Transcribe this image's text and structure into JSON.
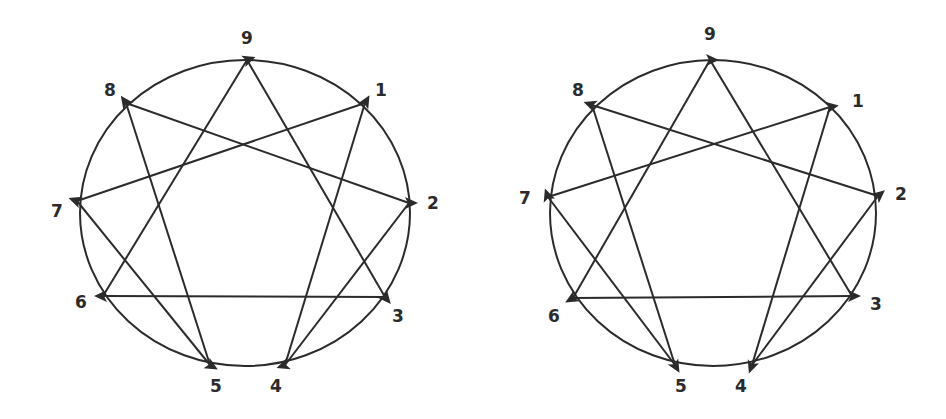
{
  "diagrams": [
    {
      "id": "left",
      "circle": {
        "cx": 245,
        "cy": 213,
        "rx": 165,
        "ry": 153
      },
      "points": {
        "9": {
          "x": 247,
          "y": 60,
          "lx": 247,
          "ly": 44
        },
        "1": {
          "x": 365,
          "y": 103,
          "lx": 381,
          "ly": 96
        },
        "2": {
          "x": 409,
          "y": 203,
          "lx": 433,
          "ly": 209
        },
        "3": {
          "x": 385,
          "y": 297,
          "lx": 398,
          "ly": 322
        },
        "4": {
          "x": 285,
          "y": 365,
          "lx": 276,
          "ly": 392
        },
        "5": {
          "x": 210,
          "y": 365,
          "lx": 216,
          "ly": 392
        },
        "6": {
          "x": 103,
          "y": 296,
          "lx": 81,
          "ly": 308
        },
        "7": {
          "x": 77,
          "y": 201,
          "lx": 57,
          "ly": 217
        },
        "8": {
          "x": 126,
          "y": 103,
          "lx": 110,
          "ly": 96
        }
      },
      "edges": [
        [
          "9",
          "3"
        ],
        [
          "3",
          "6"
        ],
        [
          "6",
          "9"
        ],
        [
          "1",
          "4"
        ],
        [
          "4",
          "2"
        ],
        [
          "2",
          "8"
        ],
        [
          "8",
          "5"
        ],
        [
          "5",
          "7"
        ],
        [
          "7",
          "1"
        ]
      ],
      "arrows": [
        {
          "at": "9",
          "angle": -20
        },
        {
          "at": "1",
          "angle": -60
        },
        {
          "at": "2",
          "angle": 0
        },
        {
          "at": "3",
          "angle": 50
        },
        {
          "at": "4",
          "angle": 160
        },
        {
          "at": "5",
          "angle": 30
        },
        {
          "at": "6",
          "angle": 180
        },
        {
          "at": "7",
          "angle": 200
        },
        {
          "at": "8",
          "angle": 235
        }
      ]
    },
    {
      "id": "right",
      "circle": {
        "cx": 713,
        "cy": 213,
        "rx": 163,
        "ry": 153
      },
      "points": {
        "9": {
          "x": 710,
          "y": 60,
          "lx": 710,
          "ly": 40
        },
        "1": {
          "x": 830,
          "y": 107,
          "lx": 858,
          "ly": 107
        },
        "2": {
          "x": 878,
          "y": 196,
          "lx": 901,
          "ly": 200
        },
        "3": {
          "x": 852,
          "y": 296,
          "lx": 876,
          "ly": 310
        },
        "4": {
          "x": 752,
          "y": 365,
          "lx": 741,
          "ly": 392
        },
        "5": {
          "x": 675,
          "y": 365,
          "lx": 681,
          "ly": 392
        },
        "6": {
          "x": 573,
          "y": 298,
          "lx": 554,
          "ly": 322
        },
        "7": {
          "x": 548,
          "y": 197,
          "lx": 525,
          "ly": 204
        },
        "8": {
          "x": 592,
          "y": 105,
          "lx": 578,
          "ly": 96
        }
      },
      "edges": [
        [
          "9",
          "3"
        ],
        [
          "3",
          "6"
        ],
        [
          "6",
          "9"
        ],
        [
          "1",
          "4"
        ],
        [
          "4",
          "2"
        ],
        [
          "2",
          "8"
        ],
        [
          "8",
          "5"
        ],
        [
          "5",
          "7"
        ],
        [
          "7",
          "1"
        ]
      ],
      "arrows": [
        {
          "at": "9",
          "angle": 0
        },
        {
          "at": "1",
          "angle": -10
        },
        {
          "at": "2",
          "angle": -40
        },
        {
          "at": "3",
          "angle": 0
        },
        {
          "at": "4",
          "angle": 110
        },
        {
          "at": "5",
          "angle": 60
        },
        {
          "at": "6",
          "angle": 150
        },
        {
          "at": "7",
          "angle": 250
        },
        {
          "at": "8",
          "angle": 200
        }
      ]
    }
  ],
  "labels": [
    "1",
    "2",
    "3",
    "4",
    "5",
    "6",
    "7",
    "8",
    "9"
  ]
}
